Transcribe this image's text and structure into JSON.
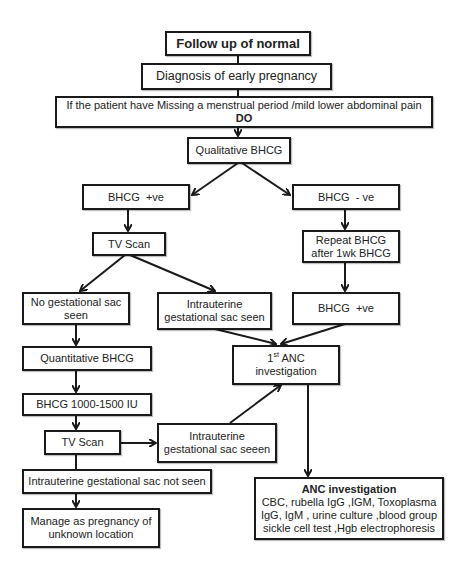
{
  "title": "Follow up of normal",
  "nodes": {
    "diagnosis": "Diagnosis of early pregnancy",
    "symptoms": {
      "line1": "If the patient have Missing a menstrual period /mild lower abdominal pain",
      "line2": "DO"
    },
    "qualitative": "Qualitative BHCG",
    "bhcg_pos": "BHCG  +ve",
    "bhcg_neg": "BHCG  - ve",
    "tv_scan_1": "TV Scan",
    "repeat_bhcg": {
      "line1": "Repeat BHCG",
      "line2": "after 1wk BHCG"
    },
    "no_sac": {
      "line1": "No gestational sac",
      "line2": "seen"
    },
    "intra_sac_seen": {
      "line1": "Intrauterine",
      "line2": "gestational sac seen"
    },
    "bhcg_pos_2": "BHCG  +ve",
    "first_anc": {
      "num": "1",
      "sup": "st",
      "line1_rest": " ANC",
      "line2": "investigation"
    },
    "quantitative": "Quantitative BHCG",
    "bhcg_range": "BHCG 1000-1500 IU",
    "tv_scan_2": "TV Scan",
    "intra_sac_seeen": {
      "line1": "Intrauterine",
      "line2": "gestational sac seeen"
    },
    "intra_not_seen": "Intrauterine gestational sac not seen",
    "manage_pul": {
      "line1": "Manage as pregnancy of",
      "line2": "unknown location"
    },
    "anc_investigation": {
      "title": "ANC investigation",
      "line1": "CBC, rubella IgG ,IGM, Toxoplasma",
      "line2": "IgG, IgM , urine culture ,blood group",
      "line3": "sickle cell test ,Hgb electrophoresis"
    }
  },
  "colors": {
    "border": "#1a1a1a",
    "background": "#ffffff",
    "text": "#222222"
  }
}
